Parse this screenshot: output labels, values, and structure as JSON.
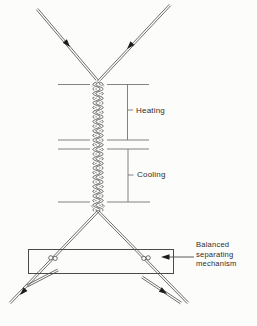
{
  "figure": {
    "labels": {
      "heating": "Heating",
      "cooling": "Cooling",
      "mechanism": "Balanced separating mechanism",
      "mechanism_lines": [
        "Balanced",
        "separating",
        "mechanism"
      ]
    },
    "icons": {
      "flow_arrow": "filled-triangle-arrowhead",
      "leader_arrow": "left-pointing-arrow-to-box"
    },
    "colors": {
      "line": "#4a4a4a",
      "zone_line": "#757575",
      "box": "#4a4a4a",
      "arrow": "#1c1c1c",
      "text": "#2e2e2e",
      "background": "#fcfcfa"
    }
  }
}
